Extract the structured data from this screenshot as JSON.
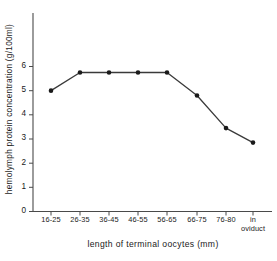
{
  "chart_data": {
    "type": "line",
    "title": "",
    "xlabel": "length of terminal oocytes (mm)",
    "ylabel": "hemolymph  protein  concentration  (g/100ml)",
    "categories": [
      "16-25",
      "26-35",
      "36-45",
      "46-55",
      "56-65",
      "66-75",
      "76-80",
      "in\noviduct"
    ],
    "values": [
      5.0,
      5.75,
      5.75,
      5.75,
      5.75,
      4.8,
      3.45,
      2.85
    ],
    "ylim": [
      0,
      6.6
    ],
    "yticks": [
      0,
      1,
      2,
      3,
      4,
      5,
      6
    ],
    "ytick_labels": [
      "0",
      "1",
      "2",
      "3",
      "4",
      "5",
      "6"
    ],
    "grid": false,
    "legend": null,
    "marker": "filled-circle",
    "line_color": "#3a3a3a",
    "marker_color": "#1a1a1a",
    "axis_color": "#4a4a4a"
  }
}
